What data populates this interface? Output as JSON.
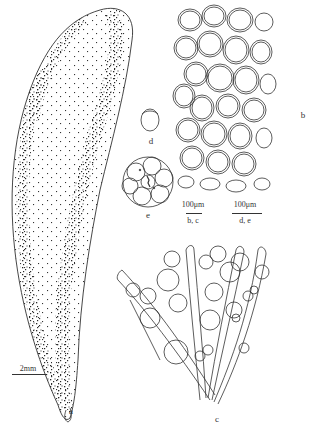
{
  "figure": {
    "panels": [
      {
        "id": "a",
        "label": "a",
        "description": "elongated thallus with dense stippling"
      },
      {
        "id": "b",
        "label": "b",
        "description": "surface cells in polygonal network"
      },
      {
        "id": "c",
        "label": "c",
        "description": "branched filaments with spherical cells"
      },
      {
        "id": "d",
        "label": "d",
        "description": "single oval cell"
      },
      {
        "id": "e",
        "label": "e",
        "description": "cluster of cells in spherical colony"
      }
    ],
    "scale_bars": [
      {
        "id": "scale-a",
        "value": "2mm",
        "applies_to": ""
      },
      {
        "id": "scale-bc",
        "value": "100μm",
        "applies_to": "b, c"
      },
      {
        "id": "scale-de",
        "value": "100μm",
        "applies_to": "d, e"
      }
    ]
  },
  "colors": {
    "ink": "#333333",
    "background": "#ffffff"
  }
}
